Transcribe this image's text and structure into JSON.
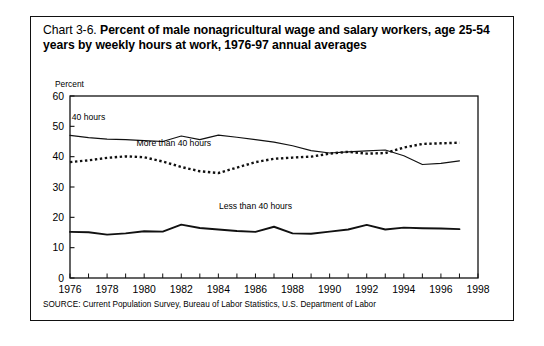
{
  "figure": {
    "title_label": "Chart 3-6.",
    "title_headline": "Percent of male nonagricultural wage and salary workers, age 25-54 years by weekly hours at work, 1976-97 annual averages",
    "source": "SOURCE: Current Population Survey, Bureau of Labor Statistics, U.S. Department of Labor"
  },
  "chart_data": {
    "type": "line",
    "title": "Percent of male nonagricultural wage and salary workers, age 25-54 years by weekly hours at work, 1976-97 annual averages",
    "xlabel": "",
    "ylabel": "Percent",
    "ylim": [
      0,
      60
    ],
    "yticks": [
      0,
      10,
      20,
      30,
      40,
      50,
      60
    ],
    "xlim": [
      1976,
      1998
    ],
    "xticks": [
      1976,
      1978,
      1980,
      1982,
      1984,
      1986,
      1988,
      1990,
      1992,
      1994,
      1996,
      1998
    ],
    "xtick_labels": [
      "1976",
      "1978",
      "1980",
      "1982",
      "1984",
      "1986",
      "1988",
      "1990",
      "1992",
      "1994",
      "1996",
      "1998"
    ],
    "minor_xticks_every": 1,
    "grid": false,
    "legend_position": "inline-annotations",
    "x": [
      1976,
      1977,
      1978,
      1979,
      1980,
      1981,
      1982,
      1983,
      1984,
      1985,
      1986,
      1987,
      1988,
      1989,
      1990,
      1991,
      1992,
      1993,
      1994,
      1995,
      1996,
      1997
    ],
    "series": [
      {
        "name": "40 hours",
        "style": "solid",
        "label_text": "40 hours",
        "label_x": 1977.0,
        "label_y": 52.0,
        "values": [
          47.0,
          46.3,
          45.8,
          45.6,
          45.3,
          45.0,
          46.8,
          45.6,
          47.1,
          46.4,
          45.6,
          44.8,
          43.6,
          42.0,
          41.2,
          41.6,
          41.9,
          42.2,
          40.3,
          37.4,
          37.8,
          38.6
        ]
      },
      {
        "name": "More than 40 hours",
        "style": "dotted",
        "label_text": "More than 40 hours",
        "label_x": 1981.6,
        "label_y": 43.6,
        "values": [
          38.2,
          38.8,
          39.6,
          40.1,
          39.8,
          38.4,
          36.6,
          35.2,
          34.6,
          36.4,
          38.2,
          39.3,
          39.7,
          40.0,
          41.0,
          41.6,
          41.0,
          41.2,
          43.0,
          44.2,
          44.4,
          44.6
        ]
      },
      {
        "name": "Less than 40 hours",
        "style": "solid-bold",
        "label_text": "Less than 40 hours",
        "label_x": 1986.0,
        "label_y": 22.6,
        "values": [
          15.2,
          15.1,
          14.3,
          14.7,
          15.4,
          15.3,
          17.6,
          16.5,
          16.0,
          15.5,
          15.2,
          16.9,
          14.7,
          14.6,
          15.3,
          16.0,
          17.5,
          16.0,
          16.6,
          16.4,
          16.3,
          16.1
        ]
      }
    ]
  },
  "colors": {
    "ink": "#111111",
    "background": "#ffffff"
  }
}
